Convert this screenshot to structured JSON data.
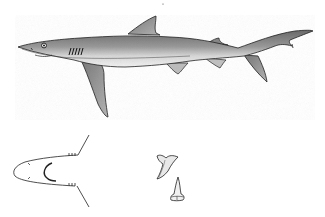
{
  "figure": {
    "panels": [
      {
        "id": "lateral-view",
        "description": "side view of shark"
      },
      {
        "id": "ventral-head-view",
        "description": "underside of head showing mouth"
      },
      {
        "id": "upper-tooth",
        "description": "upper jaw tooth"
      },
      {
        "id": "lower-tooth",
        "description": "lower jaw tooth"
      }
    ]
  },
  "colors": {
    "background": "#ffffff",
    "ink": "#1a1a1a",
    "shade_dark": "#555555",
    "shade_mid": "#8a8a8a",
    "shade_light": "#c8c8c8"
  }
}
